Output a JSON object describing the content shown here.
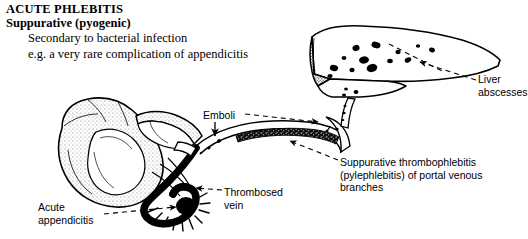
{
  "heading": {
    "title": "ACUTE PHLEBITIS",
    "subtitle": "Suppurative (pyogenic)",
    "body_line1": "Secondary to bacterial infection",
    "body_line2": "e.g. a very rare complication of appendicitis"
  },
  "annotations": {
    "liver_abscesses": "Liver\nabscesses",
    "suppurative_thrombophlebitis": "Suppurative thrombophlebitis\n(pylephlebitis) of portal venous\nbranches",
    "emboli": "Emboli",
    "thrombosed_vein": "Thrombosed\nvein",
    "acute_appendicitis": "Acute\nappendicitis"
  },
  "figure": {
    "type": "medical-illustration",
    "ink_color": "#000000",
    "background_color": "#ffffff",
    "structures": [
      "liver",
      "liver-abscesses",
      "portal-vein",
      "portal-vein-thrombus",
      "emboli",
      "cecum",
      "ileum",
      "appendix",
      "appendiceal-vein"
    ],
    "liver_abscess_count": 16,
    "leader_line_style": "dashed"
  }
}
